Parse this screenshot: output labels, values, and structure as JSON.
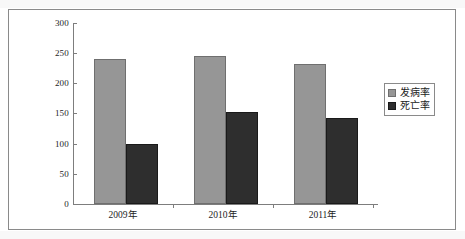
{
  "chart_data": {
    "type": "bar",
    "title": "",
    "subtitle": "",
    "xlabel": "",
    "ylabel": "",
    "categories": [
      "2009年",
      "2010年",
      "2011年"
    ],
    "series": [
      {
        "name": "发病率",
        "values": [
          240,
          245,
          232
        ],
        "color": "#969696"
      },
      {
        "name": "死亡率",
        "values": [
          100,
          152,
          142
        ],
        "color": "#2e2e2e"
      }
    ],
    "ylim": [
      0,
      300
    ],
    "yticks": [
      0,
      50,
      100,
      150,
      200,
      250,
      300
    ],
    "ytick_labels": [
      "0",
      "50",
      "100",
      "150",
      "200",
      "250",
      "300"
    ],
    "grid": false,
    "legend_position": "right",
    "annotations": []
  },
  "legend": {
    "entries": [
      {
        "label": "发病率",
        "swatch": "legend-swatch-incidence"
      },
      {
        "label": "死亡率",
        "swatch": "legend-swatch-mortality"
      }
    ]
  },
  "axes": {
    "y_labels": [
      "300",
      "250",
      "200",
      "150",
      "100",
      "50",
      "0"
    ],
    "x_labels": [
      "2009年",
      "2010年",
      "2011年"
    ]
  },
  "colors": {
    "incidence": "#969696",
    "mortality": "#2e2e2e",
    "axis": "#7d7d7d",
    "frame": "#8a8a8a",
    "background": "#ffffff"
  }
}
